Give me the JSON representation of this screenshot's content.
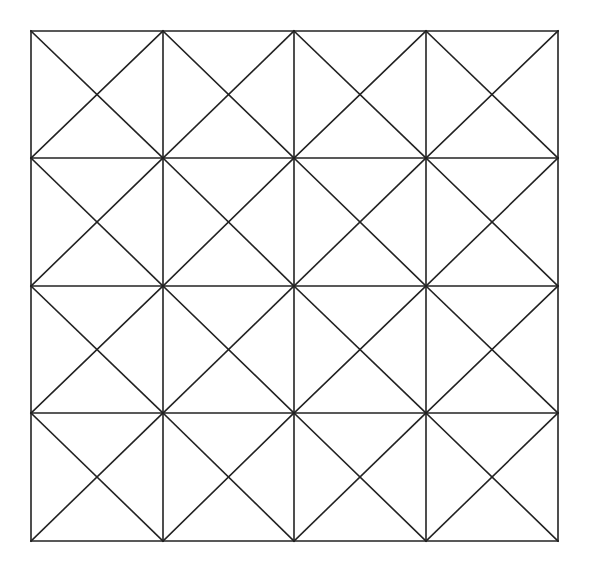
{
  "diagram": {
    "type": "grid-with-diagonals",
    "rows": 4,
    "cols": 4,
    "cell_pattern": "both-diagonals",
    "x_lines": [
      31,
      163,
      294,
      426,
      558
    ],
    "y_lines": [
      31,
      158,
      286,
      413,
      541
    ],
    "stroke_color": "#222222",
    "stroke_width": 1.6,
    "background": "#ffffff"
  }
}
